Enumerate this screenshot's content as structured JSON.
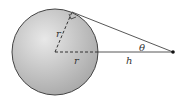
{
  "diagram": {
    "labels": {
      "radius_vertical": "r",
      "radius_horizontal": "r",
      "height": "h",
      "angle": "θ"
    },
    "colors": {
      "sphere_fill_light": "#e6e6e6",
      "sphere_fill_dark": "#a8a8a8",
      "outline": "#444444",
      "point": "#111111"
    }
  }
}
